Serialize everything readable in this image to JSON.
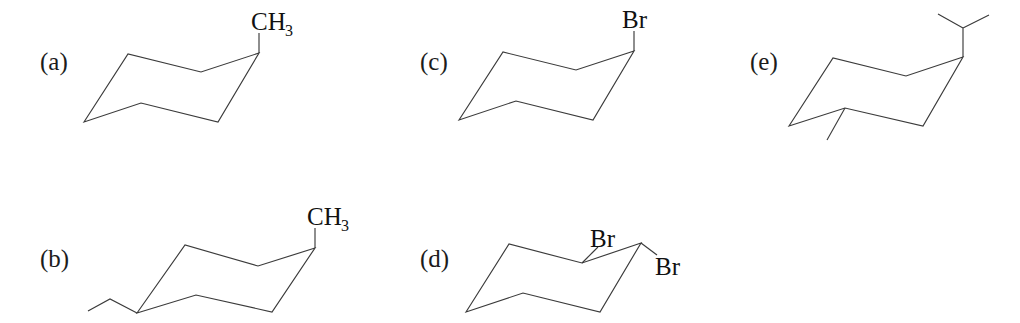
{
  "figure": {
    "kind": "chemical-structure-diagram",
    "background_color": "#ffffff",
    "bond_color": "#3b3b3b",
    "text_color": "#111111",
    "width": 1020,
    "height": 323
  },
  "panels": [
    {
      "id": "a",
      "label": "(a)",
      "label_x": 40,
      "label_y": 70,
      "ring_path": "M 84 122 L 128 54 L 201 72 L 259 53 L 218 122 L 141 103 Z",
      "substituents": [
        {
          "name": "methyl-axial-up",
          "bond_path": "M 259 53 L 259 33",
          "text": "CH",
          "subscript": "3",
          "text_x": 251,
          "text_y": 30,
          "sub_x": 285,
          "sub_y": 36
        }
      ]
    },
    {
      "id": "b",
      "label": "(b)",
      "label_x": 40,
      "label_y": 267,
      "ring_path": "M 137 313 L 185 245 L 258 266 L 315 248 L 272 312 L 196 295 Z",
      "substituents": [
        {
          "name": "methyl-equatorial-up",
          "bond_path": "M 315 248 L 315 228",
          "text": "CH",
          "subscript": "3",
          "text_x": 307,
          "text_y": 225,
          "sub_x": 341,
          "sub_y": 231
        },
        {
          "name": "methyl-equatorial-lower-left",
          "bond_path": "M 137 313 L 110 299 L 88 311",
          "text": null,
          "subscript": null
        }
      ]
    },
    {
      "id": "c",
      "label": "(c)",
      "label_x": 420,
      "label_y": 70,
      "ring_path": "M 459 120 L 503 52 L 576 70 L 634 51 L 593 120 L 516 101 Z",
      "substituents": [
        {
          "name": "bromo-axial-up",
          "bond_path": "M 634 51 L 634 31",
          "text": "Br",
          "subscript": null,
          "text_x": 622,
          "text_y": 28,
          "sub_x": null,
          "sub_y": null
        }
      ]
    },
    {
      "id": "d",
      "label": "(d)",
      "label_x": 420,
      "label_y": 267,
      "ring_path": "M 466 312 L 509 244 L 582 263 L 641 243 L 600 312 L 523 293 Z",
      "substituents": [
        {
          "name": "bromo-equatorial-upper-right",
          "bond_path": "M 582 263 L 598 247",
          "text": "Br",
          "subscript": null,
          "text_x": 590,
          "text_y": 247,
          "sub_x": null,
          "sub_y": null
        },
        {
          "name": "bromo-equatorial-lower-right",
          "bond_path": "M 641 243 L 657 255",
          "text": "Br",
          "subscript": null,
          "text_x": 655,
          "text_y": 275,
          "sub_x": null,
          "sub_y": null
        }
      ]
    },
    {
      "id": "e",
      "label": "(e)",
      "label_x": 750,
      "label_y": 70,
      "ring_path": "M 789 126 L 833 58 L 906 76 L 963 57 L 923 126 L 845 108 Z",
      "substituents": [
        {
          "name": "isopropyl-axial-up",
          "bond_path": "M 963 57 L 963 28 M 963 28 L 938 14 M 963 28 L 989 15",
          "text": null,
          "subscript": null
        },
        {
          "name": "methyl-axial-down-left",
          "bond_path": "M 845 108 L 827 140",
          "text": null,
          "subscript": null
        }
      ]
    }
  ]
}
